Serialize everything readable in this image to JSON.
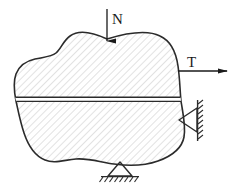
{
  "figure": {
    "body": {
      "name": "irregular-rigid-body",
      "fill": "#ffffff",
      "outline_color": "#2b2b2b",
      "hatch": {
        "name": "diagonal-hatch",
        "angle_deg": 45,
        "spacing_px": 5,
        "color": "#b8b8b8",
        "line_width": 0.8
      },
      "split_line": {
        "name": "horizontal-section-gap",
        "y": 99,
        "x_start": 13,
        "x_end": 196,
        "gap_px": 4,
        "color": "#2b2b2b"
      }
    },
    "loads": [
      {
        "name": "force-N",
        "label": "N",
        "direction": "down",
        "label_x": 112,
        "label_y": 24,
        "shaft_x": 107,
        "shaft_y_start": 9,
        "shaft_y_end": 42,
        "color": "#1a1a1a"
      },
      {
        "name": "force-T",
        "label": "T",
        "direction": "right",
        "label_x": 187,
        "label_y": 68,
        "shaft_y": 71,
        "shaft_x_start": 178,
        "shaft_x_end": 228,
        "color": "#1a1a1a"
      }
    ],
    "supports": [
      {
        "name": "pin-support-bottom",
        "type": "pin",
        "orientation": "bottom",
        "apex_x": 120,
        "apex_y": 163,
        "base_y": 176,
        "base_half_width": 12,
        "ground_x_start": 101,
        "ground_x_end": 139,
        "hatch_ticks": 7,
        "color": "#2b2b2b"
      },
      {
        "name": "pin-support-right-wall",
        "type": "pin",
        "orientation": "right",
        "apex_x": 180,
        "apex_y": 120,
        "wall_x": 198,
        "base_y_top": 108,
        "base_y_bottom": 132,
        "wall_y_start": 100,
        "wall_y_end": 141,
        "hatch_ticks": 8,
        "color": "#2b2b2b"
      }
    ]
  }
}
